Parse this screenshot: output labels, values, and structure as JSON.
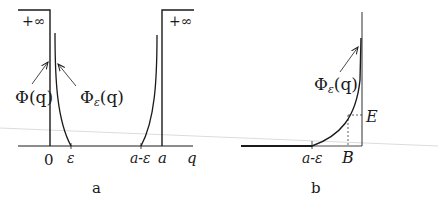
{
  "panel_a": {
    "caption": "a",
    "left_infinity_label": "+∞",
    "right_infinity_label": "+∞",
    "potential_label": "Φ(q)",
    "smoothed_label": "Φ",
    "smoothed_subscript": "ε",
    "smoothed_suffix": "(q)",
    "tick_zero": "0",
    "tick_epsilon": "ε",
    "tick_a_minus_eps": "a-ε",
    "tick_a": "a",
    "axis_label": "q"
  },
  "panel_b": {
    "caption": "b",
    "smoothed_label": "Φ",
    "smoothed_subscript": "ε",
    "smoothed_suffix": "(q)",
    "tick_a_minus_eps": "a-ε",
    "tick_B": "B",
    "level_E": "E"
  },
  "colors": {
    "ink": "#1a1a1a",
    "background": "#ffffff",
    "artifact_line": "#d8d8d8"
  }
}
